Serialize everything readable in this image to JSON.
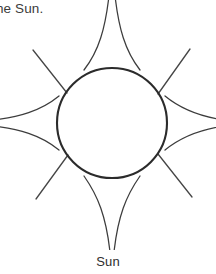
{
  "page": {
    "background_color": "#ffffff",
    "width": 216,
    "height": 274
  },
  "header": {
    "truncated_text": "he Sun."
  },
  "figure": {
    "caption": "Sun",
    "alt_name": "sun-line-drawing",
    "stroke_color": "#2b2b2b",
    "fill_color": "none",
    "circle": {
      "center_x": 112,
      "center_y": 123,
      "radius": 55,
      "stroke_width": 2.1
    },
    "rays": {
      "cardinal_count": 4,
      "diagonal_count": 4,
      "cardinal_labels": [
        "north-ray",
        "east-ray",
        "south-ray",
        "west-ray"
      ],
      "diagonal_labels": [
        "northeast-ray",
        "southeast-ray",
        "southwest-ray",
        "northwest-ray"
      ]
    }
  }
}
